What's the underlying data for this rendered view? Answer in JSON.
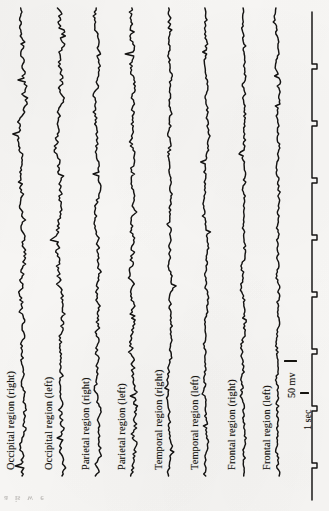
{
  "figure": {
    "kind": "eeg-recording-figure",
    "orientation": "rotated-90-ccw",
    "background_color": "#f7f6f4",
    "ink_color": "#141312",
    "channel_count": 8,
    "has_timing_trace": true
  },
  "channels": [
    {
      "id": "occipital-right",
      "label": "Occipital region (right)",
      "x": 22,
      "label_x": 5,
      "amplitude": 9.5,
      "roughness": 1.0,
      "seed": 11
    },
    {
      "id": "occipital-left",
      "label": "Occipital region (left)",
      "x": 60,
      "label_x": 43,
      "amplitude": 10.5,
      "roughness": 1.12,
      "seed": 27
    },
    {
      "id": "parietal-right",
      "label": "Parietal region (right)",
      "x": 97,
      "label_x": 80,
      "amplitude": 8.0,
      "roughness": 0.95,
      "seed": 43
    },
    {
      "id": "parietal-left",
      "label": "Parietal region (left)",
      "x": 133,
      "label_x": 116,
      "amplitude": 10.0,
      "roughness": 1.2,
      "seed": 61
    },
    {
      "id": "temporal-right",
      "label": "Temporal region (right)",
      "x": 170,
      "label_x": 153,
      "amplitude": 6.2,
      "roughness": 0.82,
      "seed": 79
    },
    {
      "id": "temporal-left",
      "label": "Temporal region (left)",
      "x": 206,
      "label_x": 189,
      "amplitude": 6.0,
      "roughness": 0.8,
      "seed": 97
    },
    {
      "id": "frontal-right",
      "label": "Frontal region (right)",
      "x": 243,
      "label_x": 226,
      "amplitude": 7.0,
      "roughness": 0.88,
      "seed": 113
    },
    {
      "id": "frontal-left",
      "label": "Frontal region (left)",
      "x": 278,
      "label_x": 261,
      "amplitude": 6.6,
      "roughness": 0.85,
      "seed": 131
    }
  ],
  "timing_trace": {
    "id": "timing-trace",
    "x": 312,
    "label": "timing trace",
    "step_width": 5,
    "step_interval": 52,
    "top": 12,
    "bottom": 500
  },
  "calibration": {
    "amplitude_label": "50 mv",
    "time_label": "1 sec"
  },
  "bleed_through": {
    "glyphs": [
      "a",
      "is",
      "w",
      "e"
    ]
  }
}
